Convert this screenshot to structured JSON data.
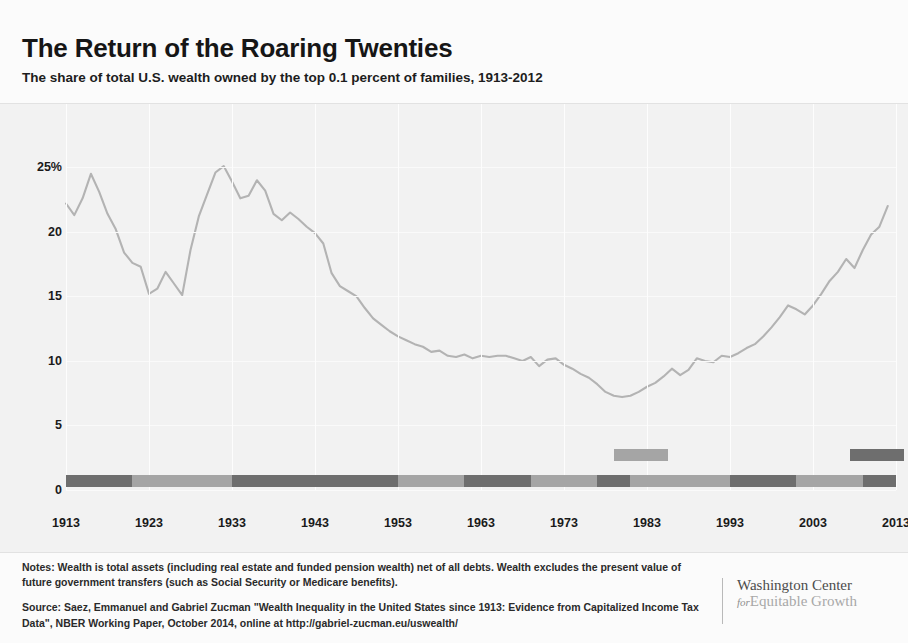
{
  "header": {
    "title": "The Return of the Roaring Twenties",
    "subtitle": "The share of total U.S. wealth owned by the top 0.1 percent of families, 1913-2012"
  },
  "footer": {
    "notes": "Notes: Wealth is total assets (including real estate and funded pension wealth) net of all debts. Wealth excludes the present value of future government transfers (such as Social Security or Medicare benefits).",
    "source": "Source: Saez, Emmanuel and Gabriel Zucman \"Wealth Inequality in the United States since 1913: Evidence from Capitalized Income Tax Data\", NBER Working Paper, October 2014, online at http://gabriel-zucman.eu/uswealth/"
  },
  "logo": {
    "line1": "Washington Center",
    "for": "for",
    "line2": "Equitable Growth"
  },
  "colors": {
    "series_line": "#b3b3b3",
    "panel_background": "#f2f2f2",
    "gridline": "#fdfdfd",
    "party_dark": "#6e6e6e",
    "party_light": "#a5a5a5",
    "text": "#1a1a1a"
  },
  "chart_data": {
    "type": "line",
    "title": "The Return of the Roaring Twenties",
    "subtitle": "The share of total U.S. wealth owned by the top 0.1 percent of families, 1913-2012",
    "xlabel": "",
    "ylabel": "",
    "xlim": [
      1913,
      2013
    ],
    "ylim": [
      0,
      26.5
    ],
    "grid": "vertical-and-horizontal-faint",
    "legend_position": "none",
    "ytick_labels": [
      "0",
      "5",
      "10",
      "15",
      "20",
      "25%"
    ],
    "ytick_values": [
      0,
      5,
      10,
      15,
      20,
      25
    ],
    "xtick_labels": [
      "1913",
      "1923",
      "1933",
      "1943",
      "1953",
      "1963",
      "1973",
      "1983",
      "1993",
      "2003",
      "2013"
    ],
    "xtick_values": [
      1913,
      1923,
      1933,
      1943,
      1953,
      1963,
      1973,
      1983,
      1993,
      2003,
      2013
    ],
    "series": [
      {
        "name": "Top 0.1% wealth share",
        "color": "#b3b3b3",
        "x": [
          1913,
          1914,
          1915,
          1916,
          1917,
          1918,
          1919,
          1920,
          1921,
          1922,
          1923,
          1924,
          1925,
          1926,
          1927,
          1928,
          1929,
          1930,
          1931,
          1932,
          1933,
          1934,
          1935,
          1936,
          1937,
          1938,
          1939,
          1940,
          1941,
          1942,
          1943,
          1944,
          1945,
          1946,
          1947,
          1948,
          1949,
          1950,
          1951,
          1952,
          1953,
          1954,
          1955,
          1956,
          1957,
          1958,
          1959,
          1960,
          1961,
          1962,
          1963,
          1964,
          1965,
          1966,
          1967,
          1968,
          1969,
          1970,
          1971,
          1972,
          1973,
          1974,
          1975,
          1976,
          1977,
          1978,
          1979,
          1980,
          1981,
          1982,
          1983,
          1984,
          1985,
          1986,
          1987,
          1988,
          1989,
          1990,
          1991,
          1992,
          1993,
          1994,
          1995,
          1996,
          1997,
          1998,
          1999,
          2000,
          2001,
          2002,
          2003,
          2004,
          2005,
          2006,
          2007,
          2008,
          2009,
          2010,
          2011,
          2012
        ],
        "y": [
          22.2,
          21.3,
          22.6,
          24.5,
          23.1,
          21.4,
          20.2,
          18.4,
          17.6,
          17.3,
          15.2,
          15.6,
          16.9,
          16.0,
          15.1,
          18.6,
          21.2,
          22.9,
          24.6,
          25.1,
          23.9,
          22.6,
          22.8,
          24.0,
          23.2,
          21.4,
          20.9,
          21.5,
          21.0,
          20.4,
          19.9,
          19.1,
          16.8,
          15.8,
          15.4,
          15.0,
          14.1,
          13.3,
          12.8,
          12.3,
          11.9,
          11.6,
          11.3,
          11.1,
          10.7,
          10.8,
          10.4,
          10.3,
          10.5,
          10.2,
          10.4,
          10.3,
          10.4,
          10.4,
          10.2,
          10.0,
          10.3,
          9.6,
          10.1,
          10.2,
          9.7,
          9.4,
          9.0,
          8.7,
          8.2,
          7.6,
          7.3,
          7.2,
          7.3,
          7.6,
          8.0,
          8.3,
          8.8,
          9.4,
          8.9,
          9.3,
          10.2,
          10.0,
          9.9,
          10.4,
          10.3,
          10.6,
          11.0,
          11.3,
          11.9,
          12.6,
          13.4,
          14.3,
          14.0,
          13.6,
          14.3,
          15.2,
          16.2,
          16.9,
          17.9,
          17.2,
          18.6,
          19.8,
          20.4,
          22.0
        ]
      }
    ],
    "party_bar": {
      "description": "Presidential party control band along the zero baseline",
      "segments": [
        {
          "start": 1913,
          "end": 1921,
          "shade": "dark"
        },
        {
          "start": 1921,
          "end": 1933,
          "shade": "light"
        },
        {
          "start": 1933,
          "end": 1953,
          "shade": "dark"
        },
        {
          "start": 1953,
          "end": 1961,
          "shade": "light"
        },
        {
          "start": 1961,
          "end": 1969,
          "shade": "dark"
        },
        {
          "start": 1969,
          "end": 1977,
          "shade": "light"
        },
        {
          "start": 1977,
          "end": 1981,
          "shade": "dark"
        },
        {
          "start": 1981,
          "end": 1993,
          "shade": "light"
        },
        {
          "start": 1993,
          "end": 2001,
          "shade": "dark"
        },
        {
          "start": 2001,
          "end": 2009,
          "shade": "light"
        },
        {
          "start": 2009,
          "end": 2013,
          "shade": "dark"
        }
      ]
    },
    "legend_keys": [
      {
        "shade": "light",
        "start": 1979,
        "end": 1985.5,
        "label": ""
      },
      {
        "shade": "dark",
        "start": 2007.5,
        "end": 2014,
        "label": ""
      }
    ]
  }
}
